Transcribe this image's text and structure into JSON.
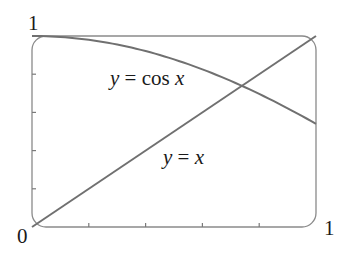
{
  "chart_data": {
    "type": "line",
    "title": "",
    "xlabel": "",
    "ylabel": "",
    "xlim": [
      0,
      1
    ],
    "ylim": [
      0,
      1
    ],
    "grid": false,
    "legend": "none (inline curve labels)",
    "x_tick_count_interior": 4,
    "y_tick_count_interior": 4,
    "tick_labels": {
      "origin": "0",
      "x_max": "1",
      "y_max": "1"
    },
    "series": [
      {
        "name": "y = cos x",
        "function": "cos(x)",
        "x": [
          0,
          0.1,
          0.2,
          0.3,
          0.4,
          0.5,
          0.6,
          0.7,
          0.8,
          0.9,
          1.0
        ],
        "values": [
          1.0,
          0.995,
          0.98,
          0.955,
          0.921,
          0.878,
          0.825,
          0.765,
          0.697,
          0.622,
          0.54
        ]
      },
      {
        "name": "y = x",
        "function": "x",
        "x": [
          0,
          1
        ],
        "values": [
          0,
          1
        ]
      }
    ],
    "annotations": [
      {
        "text": "y = cos x",
        "near": [
          0.35,
          0.75
        ]
      },
      {
        "text": "y = x",
        "near": [
          0.55,
          0.33
        ]
      }
    ],
    "intersection": {
      "x": 0.739,
      "y": 0.739
    }
  },
  "labels": {
    "origin": "0",
    "x_max": "1",
    "y_max": "1",
    "cos_label": {
      "y": "y",
      "eq": " = cos ",
      "x": "x"
    },
    "line_label": {
      "y": "y",
      "eq": " = ",
      "x": "x"
    }
  }
}
